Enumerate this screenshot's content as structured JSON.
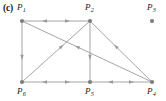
{
  "figure": {
    "panel_label": "(c)",
    "background_color": "#ffffff",
    "node_color": "#7c7c7c",
    "edge_color": "#9a9a9a",
    "label_color": "#1a1a1a",
    "width": 166,
    "height": 101
  },
  "nodes": [
    {
      "id": "P1",
      "name": "P",
      "subscript": "1",
      "x": 22,
      "y": 21,
      "label_x": 17,
      "label_y": 3,
      "isolated": false
    },
    {
      "id": "P2",
      "name": "P",
      "subscript": "2",
      "x": 90,
      "y": 21,
      "label_x": 85,
      "label_y": 3,
      "isolated": false
    },
    {
      "id": "P3",
      "name": "P",
      "subscript": "3",
      "x": 152,
      "y": 21,
      "label_x": 147,
      "label_y": 3,
      "isolated": true
    },
    {
      "id": "P4",
      "name": "P",
      "subscript": "4",
      "x": 152,
      "y": 82,
      "label_x": 147,
      "label_y": 87,
      "isolated": false
    },
    {
      "id": "P5",
      "name": "P",
      "subscript": "5",
      "x": 90,
      "y": 82,
      "label_x": 85,
      "label_y": 87,
      "isolated": false
    },
    {
      "id": "P6",
      "name": "P",
      "subscript": "6",
      "x": 22,
      "y": 82,
      "label_x": 17,
      "label_y": 87,
      "isolated": false
    }
  ],
  "edges": [
    {
      "id": "e-P1-P2",
      "from": "P1",
      "to": "P2",
      "bidirectional": true,
      "note": "top horizontal, arrows both directions"
    },
    {
      "id": "e-P6-P5",
      "from": "P6",
      "to": "P5",
      "bidirectional": true,
      "note": "bottom-left horizontal, arrows both directions"
    },
    {
      "id": "e-P5-P4",
      "from": "P5",
      "to": "P4",
      "bidirectional": true,
      "note": "bottom-right horizontal, arrows both directions"
    },
    {
      "id": "e-P1-P6",
      "from": "P1",
      "to": "P6",
      "bidirectional": false,
      "note": "left vertical, arrow down to P6"
    },
    {
      "id": "e-P2-P5",
      "from": "P2",
      "to": "P5",
      "bidirectional": false,
      "note": "middle vertical, arrow down to P5"
    },
    {
      "id": "e-P6-P2",
      "from": "P6",
      "to": "P2",
      "bidirectional": false,
      "note": "diagonal up-right, arrow toward P2"
    },
    {
      "id": "e-P4-P1",
      "from": "P4",
      "to": "P1",
      "bidirectional": false,
      "note": "long diagonal up-left, arrow toward P1"
    },
    {
      "id": "e-P4-P2",
      "from": "P4",
      "to": "P2",
      "bidirectional": false,
      "note": "diagonal up-left, arrow toward P2"
    }
  ],
  "isolated_nodes": [
    "P3"
  ],
  "node_count": 6,
  "edge_count": 8
}
